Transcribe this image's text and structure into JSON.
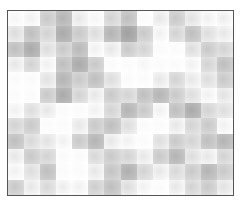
{
  "image": {
    "description": "grayscale blocky texture pattern inside a thin dark rectangular frame",
    "frame_color": "#555555",
    "background": "#ffffff"
  },
  "grid": {
    "cols": 14,
    "rows": 12,
    "tones": [
      [
        245,
        240,
        200,
        180,
        230,
        245,
        210,
        190,
        250,
        230,
        200,
        225,
        240,
        235
      ],
      [
        220,
        190,
        210,
        170,
        200,
        220,
        180,
        160,
        200,
        240,
        210,
        190,
        220,
        230
      ],
      [
        190,
        170,
        220,
        200,
        185,
        240,
        230,
        200,
        210,
        250,
        250,
        220,
        200,
        210
      ],
      [
        230,
        210,
        240,
        190,
        170,
        200,
        250,
        250,
        245,
        250,
        250,
        240,
        210,
        190
      ],
      [
        250,
        250,
        225,
        180,
        200,
        190,
        220,
        250,
        250,
        230,
        210,
        230,
        220,
        200
      ],
      [
        250,
        250,
        200,
        170,
        210,
        230,
        200,
        210,
        190,
        180,
        200,
        220,
        240,
        225
      ],
      [
        240,
        220,
        230,
        250,
        250,
        240,
        210,
        180,
        200,
        240,
        190,
        170,
        210,
        220
      ],
      [
        210,
        200,
        250,
        250,
        230,
        200,
        190,
        220,
        250,
        250,
        230,
        210,
        200,
        240
      ],
      [
        190,
        215,
        225,
        240,
        200,
        180,
        230,
        240,
        250,
        220,
        200,
        210,
        190,
        180
      ],
      [
        230,
        200,
        210,
        250,
        250,
        215,
        200,
        210,
        230,
        200,
        180,
        220,
        230,
        210
      ],
      [
        240,
        220,
        190,
        250,
        250,
        230,
        195,
        175,
        210,
        230,
        215,
        200,
        180,
        200
      ],
      [
        200,
        230,
        215,
        235,
        240,
        205,
        190,
        220,
        240,
        250,
        230,
        210,
        200,
        225
      ]
    ]
  }
}
